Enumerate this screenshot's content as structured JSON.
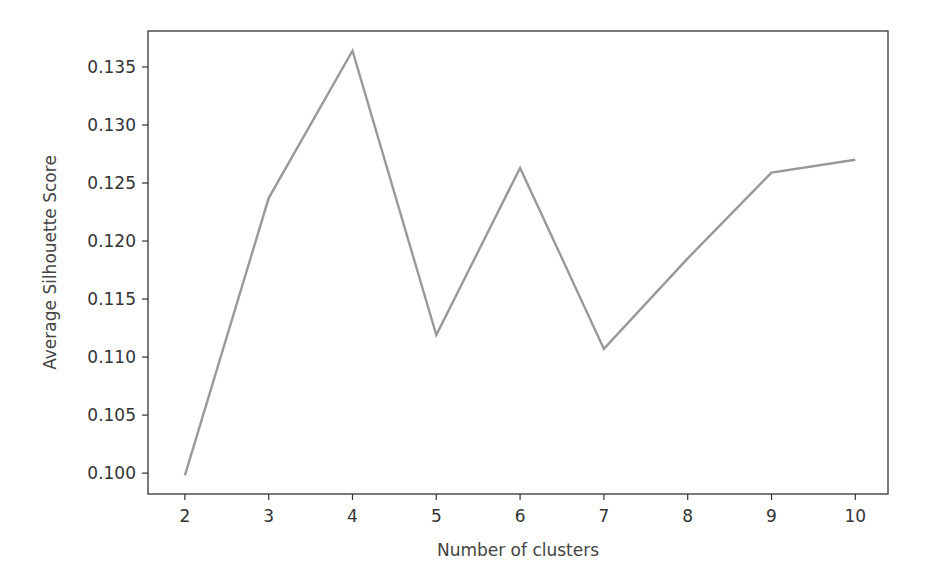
{
  "chart_data": {
    "type": "line",
    "title": "",
    "xlabel": "Number of clusters",
    "ylabel": "Average Silhouette Score",
    "x": [
      2,
      3,
      4,
      5,
      6,
      7,
      8,
      9,
      10
    ],
    "series": [
      {
        "name": "Average Silhouette Score",
        "values": [
          0.0998,
          0.1237,
          0.1364,
          0.1119,
          0.1263,
          0.1107,
          0.1185,
          0.1259,
          0.127
        ],
        "color": "#999999"
      }
    ],
    "xticks": [
      2,
      3,
      4,
      5,
      6,
      7,
      8,
      9,
      10
    ],
    "xtick_labels": [
      "2",
      "3",
      "4",
      "5",
      "6",
      "7",
      "8",
      "9",
      "10"
    ],
    "yticks": [
      0.1,
      0.105,
      0.11,
      0.115,
      0.12,
      0.125,
      0.13,
      0.135
    ],
    "ytick_labels": [
      "0.100",
      "0.105",
      "0.110",
      "0.115",
      "0.120",
      "0.125",
      "0.130",
      "0.135"
    ],
    "xlim": [
      1.56,
      10.39
    ],
    "ylim": [
      0.0982,
      0.1381
    ],
    "grid": false,
    "legend": null
  }
}
